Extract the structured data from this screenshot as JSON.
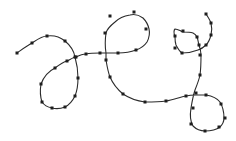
{
  "diagram": {
    "type": "smooth-curve-with-sample-points",
    "stroke_color": "#2b2b2b",
    "point_color": "#1e1e1e",
    "background": "#ffffff",
    "curve_path": "M17,53 C24,48 28,45 32,43 C38,39 42,36 47,36 C54,35 60,37 65,41 C71,46 74,51 75,57 C77,64 78,71 78,78 C78,85 77,91 75,96 C72,102 69,105 65,107 C60,109 56,109 52,108 C47,107 44,105 42,102 C40,96 40,90 41,84 C44,76 49,71 55,68 C59,65 63,62 67,61 C71,59 74,57 76,57 C80,55 83,54 86,54 C91,53 95,53 100,53 C106,53 112,53 118,53 C125,53 131,52 136,50 C142,48 145,45 147,42 C149,38 150,33 149,29 C148,24 146,21 143,18 C139,15 134,14 130,15 C124,16 119,18 115,22 C110,26 107,29 106,33 C105,40 105,47 106,53 C106,55 106,58 106,60 C107,66 108,72 110,77 C113,84 117,89 123,94 C129,98 137,101 145,102 C152,102 159,102 166,101 C173,100 180,97 186,96 C190,95 193,95 196,95 C199,95 203,95 206,95 C212,96 217,98 220,102 C223,107 224,113 224,118 C224,122 222,125 220,127 C216,130 211,131 205,131 C200,131 196,129 193,126 C190,121 190,114 191,108 C192,102 193,96 195,90 C197,85 199,80 200,75 C201,68 201,61 201,55 C201,51 200,48 199,45 C198,42 198,39 197,37 C196,35 195,34 193,33 C190,32 186,32 183,32 C180,31 178,29 175,29 C173,31 174,34 175,37 C175,40 175,42 176,45 C178,49 179,51 182,53 C187,53 193,52 198,50 C201,49 204,47 206,45 C209,42 210,39 211,35 C212,31 212,27 211,23 C210,20 208,17 206,14",
    "points": [
      [
        17,
        53
      ],
      [
        32,
        43
      ],
      [
        47,
        36
      ],
      [
        65,
        41
      ],
      [
        75,
        57
      ],
      [
        78,
        78
      ],
      [
        75,
        96
      ],
      [
        65,
        107
      ],
      [
        52,
        108
      ],
      [
        42,
        102
      ],
      [
        41,
        84
      ],
      [
        55,
        68
      ],
      [
        67,
        61
      ],
      [
        76,
        57
      ],
      [
        86,
        54
      ],
      [
        100,
        53
      ],
      [
        118,
        53
      ],
      [
        136,
        50
      ],
      [
        146,
        29
      ],
      [
        134,
        12
      ],
      [
        110,
        16
      ],
      [
        105,
        33
      ],
      [
        106,
        60
      ],
      [
        110,
        77
      ],
      [
        123,
        94
      ],
      [
        145,
        102
      ],
      [
        166,
        101
      ],
      [
        186,
        96
      ],
      [
        206,
        95
      ],
      [
        221,
        104
      ],
      [
        225,
        118
      ],
      [
        219,
        127
      ],
      [
        205,
        131
      ],
      [
        191,
        124
      ],
      [
        193,
        108
      ],
      [
        196,
        93
      ],
      [
        200,
        75
      ],
      [
        200,
        55
      ],
      [
        199,
        45
      ],
      [
        197,
        37
      ],
      [
        183,
        31
      ],
      [
        175,
        36
      ],
      [
        175,
        48
      ],
      [
        182,
        53
      ],
      [
        206,
        45
      ],
      [
        211,
        35
      ],
      [
        211,
        23
      ],
      [
        206,
        14
      ]
    ]
  }
}
